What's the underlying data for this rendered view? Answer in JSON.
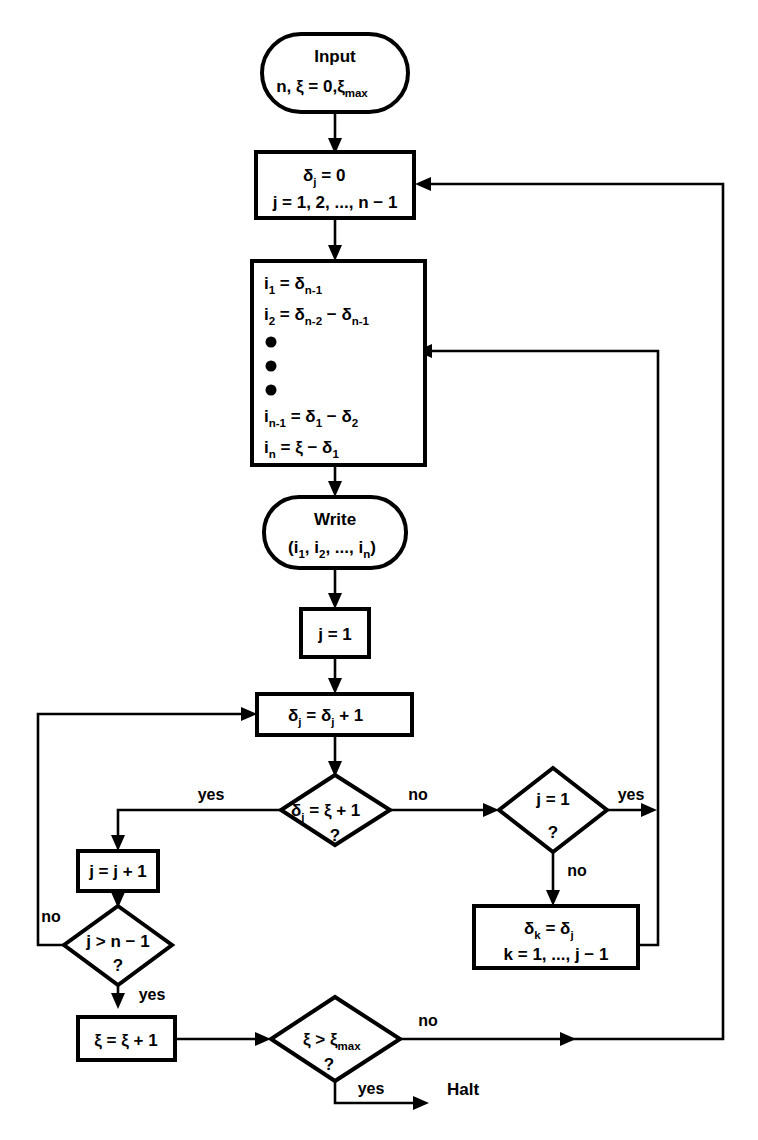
{
  "diagram": {
    "background_color": "#ffffff",
    "line_color": "#000000"
  },
  "nodes": {
    "input": {
      "type": "terminal",
      "line1": "Input",
      "line2_a": "n, ξ = 0,ξ",
      "line2_sub": "max"
    },
    "init_delta": {
      "type": "process",
      "line1_a": "δ",
      "line1_sub": "j",
      "line1_b": " = 0",
      "line2": "j = 1, 2, ..., n − 1"
    },
    "compute_i": {
      "type": "process",
      "rows": [
        {
          "lhs": "i",
          "lhs_sub": "1",
          "eq": " = ",
          "rhs": "δ",
          "rhs_sub": "n-1",
          "tail": ""
        },
        {
          "lhs": "i",
          "lhs_sub": "2",
          "eq": " = ",
          "rhs": "δ",
          "rhs_sub": "n-2",
          "tail": " − δ",
          "tail_sub": "n-1"
        },
        {
          "lhs": "i",
          "lhs_sub": "n-1",
          "eq": " = ",
          "rhs": "δ",
          "rhs_sub": "1",
          "tail": " − δ",
          "tail_sub": "2"
        },
        {
          "lhs": "i",
          "lhs_sub": "n",
          "eq": " = ",
          "rhs": "ξ − δ",
          "rhs_sub": "1",
          "tail": ""
        }
      ],
      "ellipsis_dots": 3
    },
    "write": {
      "type": "terminal",
      "line1": "Write",
      "line2_open": "(i",
      "line2_s1": "1",
      "line2_mid1": ", i",
      "line2_s2": "2",
      "line2_mid2": ", ..., i",
      "line2_s3": "n",
      "line2_close": ")"
    },
    "j_init": {
      "type": "process",
      "text": "j = 1"
    },
    "delta_inc": {
      "type": "process",
      "a": "δ",
      "a_sub": "j",
      "b": " = δ",
      "b_sub": "j",
      "c": " + 1"
    },
    "decision_delta": {
      "type": "decision",
      "a": "δ",
      "a_sub": "j",
      "b": " = ξ + 1",
      "question": "?"
    },
    "j_inc": {
      "type": "process",
      "text": "j = j + 1"
    },
    "decision_j_gt": {
      "type": "decision",
      "text": "j > n − 1",
      "question": "?"
    },
    "xi_inc": {
      "type": "process",
      "text": "ξ = ξ + 1"
    },
    "decision_j_eq_1": {
      "type": "decision",
      "text": "j = 1",
      "question": "?"
    },
    "delta_k": {
      "type": "process",
      "line1_a": "δ",
      "line1_sub_a": "k",
      "line1_b": " = δ",
      "line1_sub_b": "j",
      "line2": "k = 1, ..., j − 1"
    },
    "decision_xi_max": {
      "type": "decision",
      "a": "ξ > ξ",
      "a_sub": "max",
      "question": "?"
    },
    "halt": {
      "type": "label",
      "text": "Halt"
    }
  },
  "edge_labels": {
    "delta_yes": "yes",
    "delta_no": "no",
    "j_gt_no": "no",
    "j_gt_yes": "yes",
    "j_eq_yes": "yes",
    "j_eq_no": "no",
    "xi_max_no": "no",
    "xi_max_yes": "yes"
  }
}
